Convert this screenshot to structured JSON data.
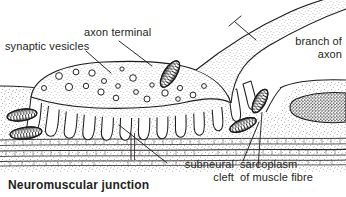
{
  "figure": {
    "title": "Neuromuscular junction",
    "background_color": "#ffffff",
    "ink_color": "#231f20",
    "width": 346,
    "height": 197
  },
  "labels": {
    "synaptic_vesicles": "synaptic vesicles",
    "axon_terminal": "axon terminal",
    "branch_of_axon": "branch of\naxon",
    "subneural_cleft": "subneural\ncleft",
    "sarcoplasm": "sarcoplasm\nof muscle fibre"
  },
  "diagram": {
    "type": "labelled-biological-diagram",
    "structures": [
      "branch of axon",
      "axon terminal",
      "synaptic vesicles",
      "mitochondria",
      "subneural cleft",
      "junctional folds",
      "sarcoplasm of muscle fibre",
      "muscle fibre nucleus",
      "myofibril striations"
    ],
    "leader_lines": [
      {
        "label": "synaptic vesicles",
        "from": [
          86,
          50
        ],
        "to": [
          112,
          72
        ]
      },
      {
        "label": "axon terminal",
        "from": [
          120,
          41
        ],
        "to": [
          152,
          65
        ]
      },
      {
        "label": "branch of axon",
        "from": [
          256,
          40
        ],
        "to": [
          238,
          23
        ]
      },
      {
        "label": "subneural cleft",
        "from": [
          166,
          163
        ],
        "to": [
          120,
          126
        ]
      },
      {
        "label": "sarcoplasm of muscle fibre",
        "from": [
          244,
          162
        ],
        "to": [
          256,
          128
        ]
      }
    ]
  }
}
